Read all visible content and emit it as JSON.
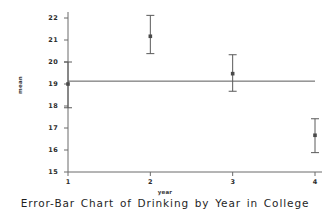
{
  "chart_data": {
    "type": "scatter",
    "title": "Error-Bar Chart of Drinking by Year in College",
    "xlabel": "year",
    "ylabel": "mean",
    "grid": false,
    "legend": "none",
    "x": [
      1,
      2,
      3,
      4
    ],
    "xtick_labels": [
      "1",
      "2",
      "3",
      "4"
    ],
    "xlim": [
      0.82,
      4.18
    ],
    "ylim": [
      15,
      22.4
    ],
    "ytick_labels": [
      "15",
      "16",
      "17",
      "18",
      "19",
      "20",
      "21",
      "22"
    ],
    "yticks": [
      15,
      16,
      17,
      18,
      19,
      20,
      21,
      22
    ],
    "series": [
      {
        "name": "mean",
        "values": [
          19.0,
          21.17,
          19.47,
          16.67
        ],
        "error_low": [
          17.92,
          20.38,
          18.67,
          15.88
        ],
        "error_high": [
          20.0,
          22.12,
          20.33,
          17.42
        ]
      }
    ],
    "reference_line": {
      "name": "grand-mean-line",
      "value": 19.13,
      "orientation": "horizontal"
    },
    "marker": "square",
    "marker_color": "#4a4a4a",
    "line_color": "#5a5a5a",
    "axis_color": "#6a6a6a",
    "background_color": "#ffffff"
  },
  "annotations": {
    "point_labels": [
      "Year 1 mean 19.0",
      "Year 2 mean 21.2",
      "Year 3 mean 19.5",
      "Year 4 mean 16.7"
    ]
  }
}
